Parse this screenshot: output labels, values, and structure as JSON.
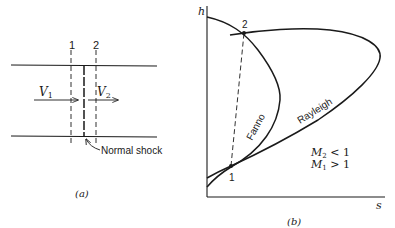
{
  "panel_a": {
    "caption": "(a)",
    "station_1_label": "1",
    "station_2_label": "2",
    "velocity_1_label": "V",
    "velocity_1_sub": "1",
    "velocity_2_label": "V",
    "velocity_2_sub": "2",
    "shock_label": "Normal shock"
  },
  "panel_b": {
    "caption": "(b)",
    "y_axis_label": "h",
    "x_axis_label": "s",
    "point_1_label": "1",
    "point_2_label": "2",
    "fanno_label": "Fanno",
    "rayleigh_label": "Rayleigh",
    "condition_1": {
      "var": "M",
      "sub": "2",
      "rel": " < 1"
    },
    "condition_2": {
      "var": "M",
      "sub": "1",
      "rel": " > 1"
    }
  },
  "colors": {
    "ink": "#1a1a1a",
    "background": "#ffffff"
  }
}
